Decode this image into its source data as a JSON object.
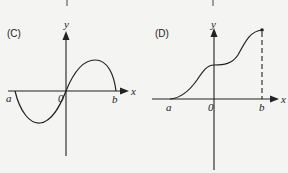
{
  "panels": [
    {
      "id": "C",
      "label": "(C)",
      "y_axis_label": "y",
      "x_axis_label": "x",
      "tick_labels": {
        "a": "a",
        "origin": "0",
        "b": "b"
      },
      "curve": "one period of a sine-like wave from a to b: negative lobe on [a,0], positive lobe on [0,b]"
    },
    {
      "id": "D",
      "label": "(D)",
      "y_axis_label": "y",
      "x_axis_label": "x",
      "tick_labels": {
        "a": "a",
        "origin": "0",
        "b": "b"
      },
      "curve": "increasing S-shaped curve from a with a plateau near x=0, ending at a marked point above b with dashed vertical line to b"
    }
  ],
  "colors": {
    "ink": "#222222",
    "background": "#f4f4f2"
  }
}
